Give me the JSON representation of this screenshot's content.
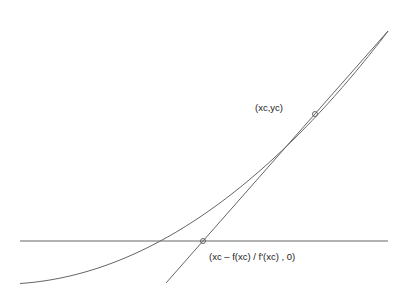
{
  "diagram": {
    "labels": {
      "tangent_point": "(xc,yc)",
      "root_estimate": "(xc – f(xc) / f'(xc) , 0)"
    },
    "points": {
      "tangent_point": {
        "x": 315,
        "y": 114
      },
      "root_estimate": {
        "x": 203,
        "y": 241
      }
    },
    "colors": {
      "line": "#666666",
      "text": "#222222"
    }
  }
}
